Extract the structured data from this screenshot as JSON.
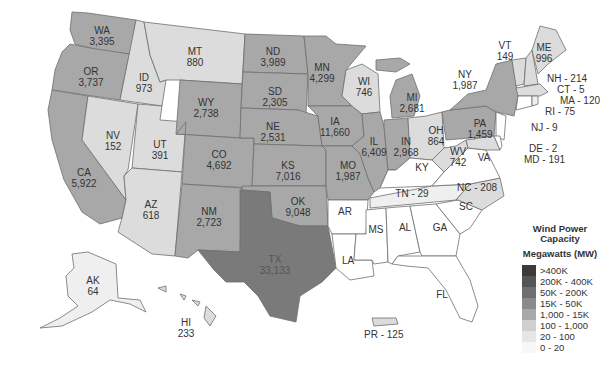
{
  "map": {
    "title": "Wind Power Capacity",
    "subtitle": "Megawatts (MW)"
  },
  "legend": {
    "title": "Wind Power Capacity",
    "units": "Megawatts (MW)",
    "bins": [
      {
        "label": ">400K",
        "color": "#3a3a3a"
      },
      {
        "label": "200K - 400K",
        "color": "#555555"
      },
      {
        "label": "50K - 200K",
        "color": "#6f6f6f"
      },
      {
        "label": "15K - 50K",
        "color": "#8a8a8a"
      },
      {
        "label": "1,000 - 15K",
        "color": "#a8a8a8"
      },
      {
        "label": "100 - 1,000",
        "color": "#cfcfcf"
      },
      {
        "label": "20 - 100",
        "color": "#e6e6e6"
      },
      {
        "label": "0 - 20",
        "color": "#ffffff"
      }
    ]
  },
  "states": {
    "WA": {
      "abbr": "WA",
      "value": "3,395"
    },
    "OR": {
      "abbr": "OR",
      "value": "3,737"
    },
    "CA": {
      "abbr": "CA",
      "value": "5,922"
    },
    "ID": {
      "abbr": "ID",
      "value": "973"
    },
    "NV": {
      "abbr": "NV",
      "value": "152"
    },
    "UT": {
      "abbr": "UT",
      "value": "391"
    },
    "AZ": {
      "abbr": "AZ",
      "value": "618"
    },
    "MT": {
      "abbr": "MT",
      "value": "880"
    },
    "WY": {
      "abbr": "WY",
      "value": "2,738"
    },
    "CO": {
      "abbr": "CO",
      "value": "4,692"
    },
    "NM": {
      "abbr": "NM",
      "value": "2,723"
    },
    "ND": {
      "abbr": "ND",
      "value": "3,989"
    },
    "SD": {
      "abbr": "SD",
      "value": "2,305"
    },
    "NE": {
      "abbr": "NE",
      "value": "2,531"
    },
    "KS": {
      "abbr": "KS",
      "value": "7,016"
    },
    "OK": {
      "abbr": "OK",
      "value": "9,048"
    },
    "TX": {
      "abbr": "TX",
      "value": "33,133"
    },
    "MN": {
      "abbr": "MN",
      "value": "4,299"
    },
    "IA": {
      "abbr": "IA",
      "value": "11,660"
    },
    "MO": {
      "abbr": "MO",
      "value": "1,987"
    },
    "AR": {
      "abbr": "AR",
      "value": ""
    },
    "LA": {
      "abbr": "LA",
      "value": ""
    },
    "WI": {
      "abbr": "WI",
      "value": "746"
    },
    "IL": {
      "abbr": "IL",
      "value": "6,409"
    },
    "MI": {
      "abbr": "MI",
      "value": "2,681"
    },
    "IN": {
      "abbr": "IN",
      "value": "2,968"
    },
    "OH": {
      "abbr": "OH",
      "value": "864"
    },
    "KY": {
      "abbr": "KY",
      "value": ""
    },
    "TN": {
      "label": "TN - 29"
    },
    "MS": {
      "abbr": "MS",
      "value": ""
    },
    "AL": {
      "abbr": "AL",
      "value": ""
    },
    "GA": {
      "abbr": "GA",
      "value": ""
    },
    "FL": {
      "abbr": "FL",
      "value": ""
    },
    "SC": {
      "abbr": "SC",
      "value": ""
    },
    "NC": {
      "label": "NC - 208"
    },
    "VA": {
      "abbr": "VA",
      "value": ""
    },
    "WV": {
      "abbr": "WV",
      "value": "742"
    },
    "PA": {
      "abbr": "PA",
      "value": "1,459"
    },
    "NY": {
      "abbr": "NY",
      "value": "1,987"
    },
    "VT": {
      "abbr": "VT",
      "value": "149"
    },
    "ME": {
      "abbr": "ME",
      "value": "996"
    },
    "NH": {
      "label": "NH - 214"
    },
    "CT": {
      "label": "CT - 5"
    },
    "MA": {
      "label": "MA - 120"
    },
    "RI": {
      "label": "RI - 75"
    },
    "NJ": {
      "label": "NJ - 9"
    },
    "DE": {
      "label": "DE - 2"
    },
    "MD": {
      "label": "MD - 191"
    },
    "AK": {
      "abbr": "AK",
      "value": "64"
    },
    "HI": {
      "abbr": "HI",
      "value": "233"
    },
    "PR": {
      "label": "PR - 125"
    }
  }
}
